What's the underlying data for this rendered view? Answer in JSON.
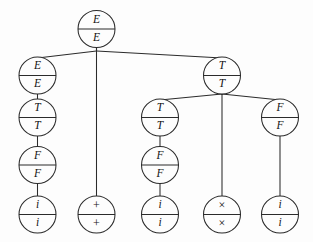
{
  "diagram": {
    "kind": "parse-tree",
    "background_color": "#fdfdfd",
    "stroke_color": "#2b2b2b",
    "text_color": "#131313",
    "node_radius": 18.5,
    "nodes": [
      {
        "id": "n0",
        "top": "E",
        "bottom": "E",
        "cx": 96.5,
        "cy": 29.0,
        "style": "italic"
      },
      {
        "id": "n1",
        "top": "E",
        "bottom": "E",
        "cx": 37.5,
        "cy": 75.5,
        "style": "italic"
      },
      {
        "id": "n2",
        "top": "+",
        "bottom": "+",
        "cx": 96.5,
        "cy": 214.5,
        "style": "sym"
      },
      {
        "id": "n3",
        "top": "T",
        "bottom": "T",
        "cx": 222.0,
        "cy": 75.5,
        "style": "italic"
      },
      {
        "id": "n4",
        "top": "T",
        "bottom": "T",
        "cx": 37.5,
        "cy": 117.5,
        "style": "italic"
      },
      {
        "id": "n5",
        "top": "F",
        "bottom": "F",
        "cx": 37.5,
        "cy": 165.0,
        "style": "italic"
      },
      {
        "id": "n6",
        "top": "i",
        "bottom": "i",
        "cx": 37.5,
        "cy": 214.5,
        "style": "italic"
      },
      {
        "id": "n7",
        "top": "T",
        "bottom": "T",
        "cx": 160.0,
        "cy": 117.5,
        "style": "italic"
      },
      {
        "id": "n8",
        "top": "F",
        "bottom": "F",
        "cx": 160.0,
        "cy": 165.0,
        "style": "italic"
      },
      {
        "id": "n9",
        "top": "i",
        "bottom": "i",
        "cx": 160.0,
        "cy": 214.5,
        "style": "italic"
      },
      {
        "id": "n10",
        "top": "×",
        "bottom": "×",
        "cx": 222.0,
        "cy": 214.5,
        "style": "sym"
      },
      {
        "id": "n11",
        "top": "F",
        "bottom": "F",
        "cx": 280.0,
        "cy": 117.5,
        "style": "italic"
      },
      {
        "id": "n12",
        "top": "i",
        "bottom": "i",
        "cx": 280.0,
        "cy": 214.5,
        "style": "italic"
      }
    ],
    "edges": [
      {
        "from": "n0",
        "to": "n1",
        "via_y": 51.0
      },
      {
        "from": "n0",
        "to": "n2",
        "via_y": 51.0
      },
      {
        "from": "n0",
        "to": "n3",
        "via_y": 51.0
      },
      {
        "from": "n1",
        "to": "n4",
        "via_y": null
      },
      {
        "from": "n4",
        "to": "n5",
        "via_y": null
      },
      {
        "from": "n5",
        "to": "n6",
        "via_y": null
      },
      {
        "from": "n3",
        "to": "n7",
        "via_y": 94.0
      },
      {
        "from": "n3",
        "to": "n10",
        "via_y": 94.0
      },
      {
        "from": "n3",
        "to": "n11",
        "via_y": 94.0
      },
      {
        "from": "n7",
        "to": "n8",
        "via_y": null
      },
      {
        "from": "n8",
        "to": "n9",
        "via_y": null
      },
      {
        "from": "n11",
        "to": "n12",
        "via_y": null
      }
    ]
  }
}
